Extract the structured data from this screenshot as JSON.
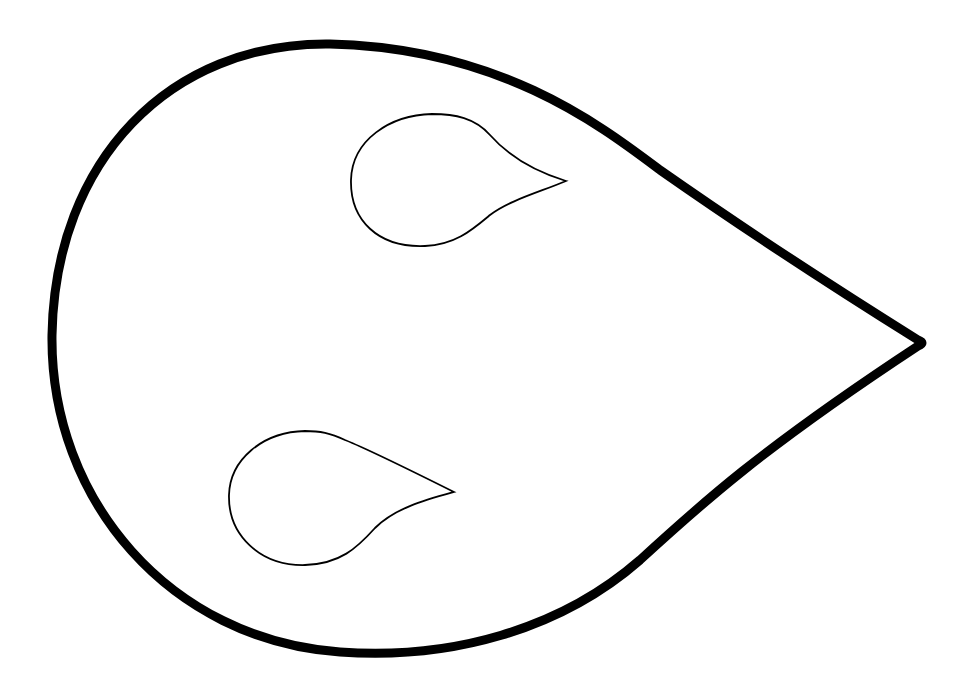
{
  "canvas": {
    "width": 972,
    "height": 691,
    "background": "#ffffff"
  },
  "stroke_color": "#000000",
  "shapes": [
    {
      "name": "large-teardrop",
      "stroke_width": 9,
      "path": "M 918 340 C 870 310, 760 240, 660 170 C 600 125, 500 48, 330 44 C 170 42, 55 160, 52 335 C 50 500, 170 640, 340 652 C 450 660, 560 630, 640 560 C 700 505, 760 450, 918 346 Q 926 343, 918 340 Z"
    },
    {
      "name": "small-teardrop-upper",
      "stroke_width": 1.8,
      "path": "M 566 181 C 530 170, 505 152, 490 135 C 475 118, 455 114, 432 114 C 390 115, 352 140, 351 180 C 350 220, 378 248, 425 246 C 455 245, 472 230, 490 215 C 510 200, 540 192, 566 181 Z"
    },
    {
      "name": "small-teardrop-lower",
      "stroke_width": 1.8,
      "path": "M 454 492 C 420 475, 370 450, 345 440 C 330 433, 320 431, 305 431 C 262 432, 230 460, 229 495 C 228 535, 260 566, 305 565 C 340 564, 357 548, 375 528 C 395 508, 425 500, 454 492 Z"
    }
  ]
}
